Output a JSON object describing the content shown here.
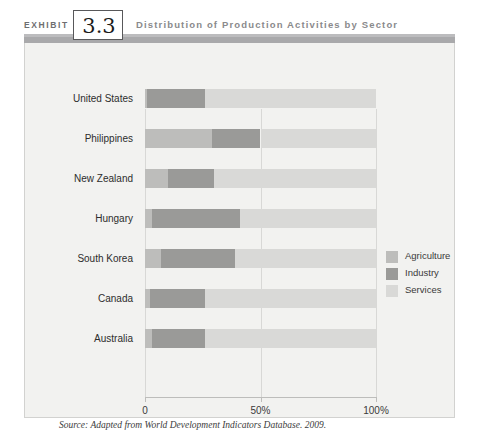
{
  "header": {
    "exhibit_word": "EXHIBIT",
    "exhibit_number": "3.3",
    "title": "Distribution of Production Activities by Sector"
  },
  "source": {
    "text": "Source: Adapted from World Development Indicators Database. 2009. http://publications.worldbank.org/ecommerce/products."
  },
  "colors": {
    "agriculture": "#bdbdbb",
    "industry": "#9a9a98",
    "services": "#d9d9d7",
    "panel_bg": "#f2f2f0",
    "panel_border": "#d2d2d0",
    "gridline": "#d8d8d6",
    "header_rule": "#a9a9ab",
    "title_text": "#8a8a8c"
  },
  "chart_data": {
    "type": "bar",
    "orientation": "horizontal",
    "stacked": true,
    "title": "Distribution of Production Activities by Sector",
    "xlabel": "",
    "ylabel": "",
    "xlim": [
      0,
      100
    ],
    "xticks": [
      0,
      50,
      100
    ],
    "xtick_labels": [
      "0",
      "50%",
      "100%"
    ],
    "grid": true,
    "legend_position": "right",
    "categories": [
      "United States",
      "Philippines",
      "New Zealand",
      "Hungary",
      "South Korea",
      "Canada",
      "Australia"
    ],
    "series": [
      {
        "name": "Agriculture",
        "color": "#bdbdbb",
        "values": [
          1,
          29,
          10,
          3,
          7,
          2,
          3
        ]
      },
      {
        "name": "Industry",
        "color": "#9a9a98",
        "values": [
          25,
          21,
          20,
          38,
          32,
          24,
          23
        ]
      },
      {
        "name": "Services",
        "color": "#d9d9d7",
        "values": [
          74,
          50,
          70,
          59,
          61,
          74,
          74
        ]
      }
    ]
  },
  "legend": {
    "items": [
      {
        "label": "Agriculture",
        "color": "#bdbdbb"
      },
      {
        "label": "Industry",
        "color": "#9a9a98"
      },
      {
        "label": "Services",
        "color": "#d9d9d7"
      }
    ]
  }
}
